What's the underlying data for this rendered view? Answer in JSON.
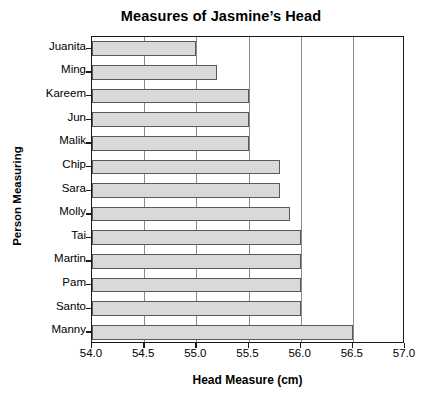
{
  "chart_data": {
    "type": "bar",
    "orientation": "horizontal",
    "title": "Measures of Jasmine’s Head",
    "xlabel": "Head Measure (cm)",
    "ylabel": "Person Measuring",
    "categories": [
      "Juanita",
      "Ming",
      "Kareem",
      "Jun",
      "Malik",
      "Chip",
      "Sara",
      "Molly",
      "Tai",
      "Martin",
      "Pam",
      "Santo",
      "Manny"
    ],
    "values": [
      55.0,
      55.2,
      55.5,
      55.5,
      55.5,
      55.8,
      55.8,
      55.9,
      56.0,
      56.0,
      56.0,
      56.0,
      56.5
    ],
    "xlim": [
      54.0,
      57.0
    ],
    "xticks": [
      "54.0",
      "54.5",
      "55.0",
      "55.5",
      "56.0",
      "56.5",
      "57.0"
    ],
    "xtick_values": [
      54.0,
      54.5,
      55.0,
      55.5,
      56.0,
      56.5,
      57.0
    ],
    "grid": "vertical",
    "legend": "none",
    "bar_fill_color": "#d9d9d9",
    "bar_edge_color": "#595959",
    "gridline_color": "#8a8a8a",
    "axis_color": "#1a1a1a"
  }
}
